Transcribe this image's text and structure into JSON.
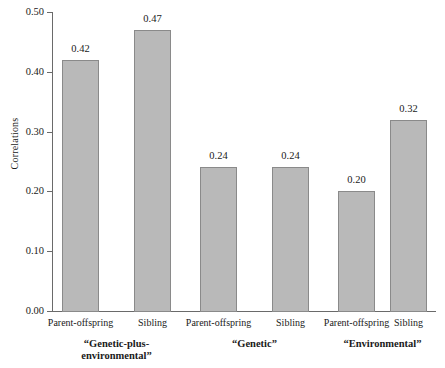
{
  "chart_data": {
    "type": "bar",
    "title": "",
    "xlabel": "",
    "ylabel": "Correlations",
    "ylim": [
      0.0,
      0.5
    ],
    "yticks": [
      "0.00",
      "0.10",
      "0.20",
      "0.30",
      "0.40",
      "0.50"
    ],
    "ytick_values": [
      0.0,
      0.1,
      0.2,
      0.3,
      0.4,
      0.5
    ],
    "grid": false,
    "legend": "none",
    "categories": [
      "Parent-offspring",
      "Sibling",
      "Parent-offspring",
      "Sibling",
      "Parent-offspring",
      "Sibling"
    ],
    "values": [
      0.42,
      0.47,
      0.24,
      0.24,
      0.2,
      0.32
    ],
    "value_labels": [
      "0.42",
      "0.47",
      "0.24",
      "0.24",
      "0.20",
      "0.32"
    ],
    "groups": [
      {
        "label": "“Genetic-plus-\nenvironmental”",
        "categories": [
          "Parent-offspring",
          "Sibling"
        ],
        "values": [
          0.42,
          0.47
        ]
      },
      {
        "label": "“Genetic”",
        "categories": [
          "Parent-offspring",
          "Sibling"
        ],
        "values": [
          0.24,
          0.24
        ]
      },
      {
        "label": "“Environmental”",
        "categories": [
          "Parent-offspring",
          "Sibling"
        ],
        "values": [
          0.2,
          0.32
        ]
      }
    ],
    "colors": {
      "bar_fill": "#b9b9b9",
      "bar_edge": "#8a8a8a",
      "axis": "#6a6a6a",
      "text": "#1a1a1a",
      "background": "#ffffff"
    }
  }
}
